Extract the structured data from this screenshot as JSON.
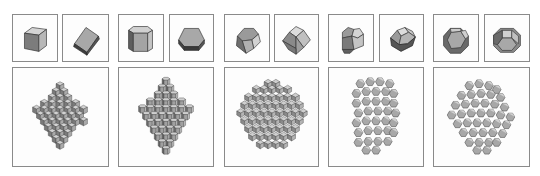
{
  "figure": {
    "colors": {
      "border": "#8a8a8a",
      "face_light": "#c9c9c9",
      "face_mid": "#9a9a9a",
      "face_dark": "#6e6e6e",
      "edge": "#3a3a3a",
      "background": "#ffffff"
    },
    "panels": [
      {
        "id": "cube",
        "shape": "cube",
        "views": [
          "cube-oblique",
          "cube-tilted"
        ],
        "cluster": "cube-octahedral-cluster"
      },
      {
        "id": "hexagonal-prism",
        "shape": "hexagonal prism",
        "views": [
          "hexprism-side",
          "hexprism-top"
        ],
        "cluster": "hexprism-cluster"
      },
      {
        "id": "rhombic-dodecahedron",
        "shape": "rhombic dodecahedron",
        "views": [
          "rd-view-1",
          "rd-view-2"
        ],
        "cluster": "rd-spherical-cluster"
      },
      {
        "id": "elongated-dodecahedron",
        "shape": "elongated dodecahedron",
        "views": [
          "ed-view-1",
          "ed-view-2"
        ],
        "cluster": "ed-columnar-cluster"
      },
      {
        "id": "truncated-octahedron",
        "shape": "truncated octahedron",
        "views": [
          "to-hex-face",
          "to-square-face"
        ],
        "cluster": "to-cluster"
      }
    ]
  }
}
